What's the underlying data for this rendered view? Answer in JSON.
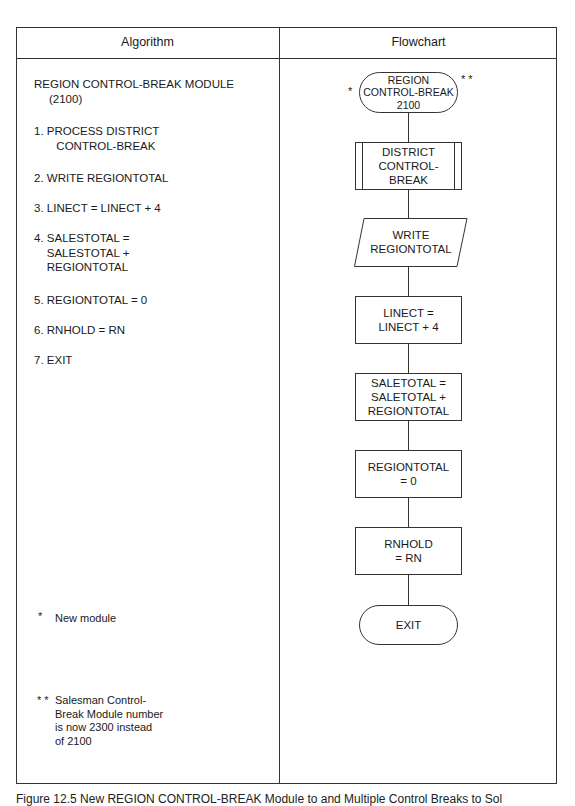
{
  "table": {
    "headers": [
      "Algorithm",
      "Flowchart"
    ]
  },
  "algorithm": {
    "title": "REGION CONTROL-BREAK MODULE",
    "title_number": "(2100)",
    "steps": [
      "1. PROCESS DISTRICT\n       CONTROL-BREAK",
      "2. WRITE REGIONTOTAL",
      "3. LINECT = LINECT + 4",
      "4. SALESTOTAL =\n    SALESTOTAL +\n    REGIONTOTAL",
      "5. REGIONTOTAL = 0",
      "6. RNHOLD = RN",
      "7. EXIT"
    ],
    "notes": [
      {
        "marker": "*",
        "text": "New module"
      },
      {
        "marker": "* *",
        "text": "Salesman Control-\nBreak Module number\nis now 2300 instead\nof 2100"
      }
    ]
  },
  "flowchart": {
    "start": {
      "type": "terminal",
      "label": "REGION\nCONTROL-BREAK\n2100",
      "left_marker": "*",
      "right_marker": "* *"
    },
    "nodes": [
      {
        "type": "predefined-process",
        "label": "DISTRICT\nCONTROL-\nBREAK"
      },
      {
        "type": "input-output",
        "label": "WRITE\nREGIONTOTAL"
      },
      {
        "type": "process",
        "label": "LINECT =\nLINECT + 4"
      },
      {
        "type": "process",
        "label": "SALETOTAL =\nSALETOTAL +\nREGIONTOTAL"
      },
      {
        "type": "process",
        "label": "REGIONTOTAL\n= 0"
      },
      {
        "type": "process",
        "label": "RNHOLD\n= RN"
      }
    ],
    "end": {
      "type": "terminal",
      "label": "EXIT"
    }
  },
  "caption": "Figure 12.5     New REGION CONTROL-BREAK Module to and Multiple Control Breaks to Sol"
}
